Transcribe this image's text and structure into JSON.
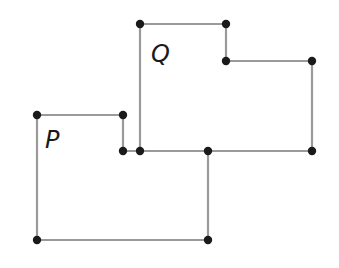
{
  "diagram": {
    "type": "rectilinear-polygons",
    "shapes": [
      {
        "label": "P",
        "label_pos": [
          45,
          148
        ],
        "vertices": [
          [
            37,
            115
          ],
          [
            123,
            115
          ],
          [
            123,
            151
          ],
          [
            208,
            151
          ],
          [
            208,
            240
          ],
          [
            37,
            240
          ]
        ]
      },
      {
        "label": "Q",
        "label_pos": [
          151,
          62
        ],
        "vertices": [
          [
            140,
            24
          ],
          [
            226,
            24
          ],
          [
            226,
            61
          ],
          [
            312,
            61
          ],
          [
            312,
            151
          ],
          [
            140,
            151
          ]
        ]
      }
    ],
    "points": [
      [
        37,
        115
      ],
      [
        123,
        115
      ],
      [
        123,
        151
      ],
      [
        140,
        151
      ],
      [
        140,
        24
      ],
      [
        226,
        24
      ],
      [
        226,
        61
      ],
      [
        312,
        61
      ],
      [
        312,
        151
      ],
      [
        208,
        151
      ],
      [
        208,
        240
      ],
      [
        37,
        240
      ]
    ],
    "colors": {
      "edge": "#9a9a9a",
      "vertex": "#1a1a1a",
      "label": "#1a1a1a"
    }
  }
}
